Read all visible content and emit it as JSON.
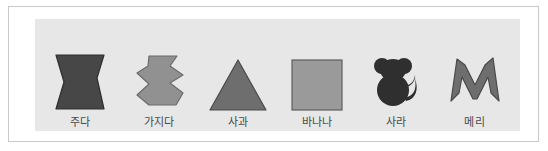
{
  "panel": {
    "background_color": "#e7e7e7",
    "frame_color": "#c9c9c9",
    "page_background": "#ffffff"
  },
  "cards": [
    {
      "label": "주다",
      "icon_name": "hourglass-bowtie-shape",
      "shape": "bowtie",
      "fill": "#474747",
      "stroke": "#2e2e2e"
    },
    {
      "label": "가지다",
      "icon_name": "zigzag-hexagon-shape",
      "shape": "zigzag-hexagon",
      "fill": "#919191",
      "stroke": "#6b6b6b"
    },
    {
      "label": "사과",
      "icon_name": "triangle-shape",
      "shape": "triangle",
      "fill": "#6e6e6e",
      "stroke": "#4a4a4a"
    },
    {
      "label": "바나나",
      "icon_name": "square-shape",
      "shape": "square",
      "fill": "#9a9a9a",
      "stroke": "#5f5f5f"
    },
    {
      "label": "사라",
      "icon_name": "monkey-silhouette",
      "shape": "monkey",
      "fill": "#2f2f2f",
      "stroke": "#2f2f2f"
    },
    {
      "label": "메리",
      "icon_name": "letter-m-shape",
      "shape": "letter-m",
      "fill": "#6e6e6e",
      "stroke": "#4a4a4a"
    }
  ]
}
